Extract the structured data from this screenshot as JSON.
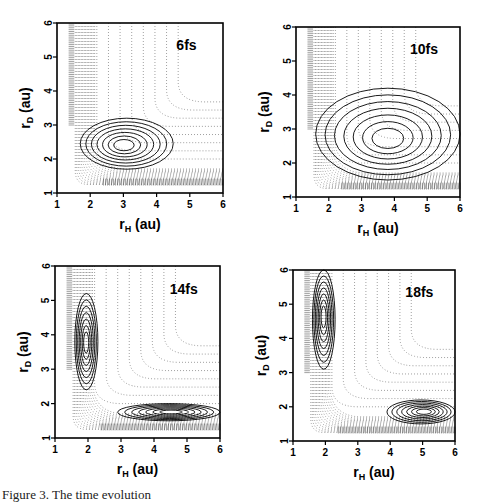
{
  "figure": {
    "caption": "Figure 3. The time evolution",
    "panels": [
      {
        "label": "6fs",
        "xlabel_main": "r",
        "xlabel_sub": "H",
        "xlabel_unit": "(au)",
        "ylabel_main": "r",
        "ylabel_sub": "D",
        "ylabel_unit": "(au)"
      },
      {
        "label": "10fs",
        "xlabel_main": "r",
        "xlabel_sub": "H",
        "xlabel_unit": "(au)",
        "ylabel_main": "r",
        "ylabel_sub": "D",
        "ylabel_unit": "(au)"
      },
      {
        "label": "14fs",
        "xlabel_main": "r",
        "xlabel_sub": "H",
        "xlabel_unit": "(au)",
        "ylabel_main": "r",
        "ylabel_sub": "D",
        "ylabel_unit": "(au)"
      },
      {
        "label": "18fs",
        "xlabel_main": "r",
        "xlabel_sub": "H",
        "xlabel_unit": "(au)",
        "ylabel_main": "r",
        "ylabel_sub": "D",
        "ylabel_unit": "(au)"
      }
    ],
    "xticks": [
      "1",
      "2",
      "3",
      "4",
      "5",
      "6"
    ],
    "yticks": [
      "1",
      "2",
      "3",
      "4",
      "5",
      "6"
    ]
  },
  "chart_data": [
    {
      "type": "heatmap",
      "title": "6fs",
      "xlabel": "r_H (au)",
      "ylabel": "r_D (au)",
      "xlim": [
        1,
        6
      ],
      "ylim": [
        1,
        6
      ],
      "description": "Wavepacket contours (solid) localized near r_H 1.7-4.5, r_D 1.7-3.2 over dotted potential energy contours",
      "packets": [
        {
          "center": [
            2.4,
            2.1
          ],
          "extent_x": [
            1.7,
            4.5
          ],
          "extent_y": [
            1.7,
            3.2
          ]
        }
      ]
    },
    {
      "type": "heatmap",
      "title": "10fs",
      "xlabel": "r_H (au)",
      "ylabel": "r_D (au)",
      "xlim": [
        1,
        6
      ],
      "ylim": [
        1,
        6
      ],
      "description": "Wavepacket elongated along L-shaped valley from r_D~4.2 down to r_H~6",
      "packets": [
        {
          "center": [
            3.8,
            1.8
          ],
          "extent_x": [
            1.6,
            6
          ],
          "extent_y": [
            1.5,
            4.2
          ]
        }
      ]
    },
    {
      "type": "heatmap",
      "title": "14fs",
      "xlabel": "r_H (au)",
      "ylabel": "r_D (au)",
      "xlim": [
        1,
        6
      ],
      "ylim": [
        1,
        6
      ],
      "description": "Wavepacket split into two channels",
      "packets": [
        {
          "center": [
            1.9,
            3.6
          ],
          "extent_x": [
            1.6,
            2.3
          ],
          "extent_y": [
            2.4,
            5.2
          ]
        },
        {
          "center": [
            5,
            1.8
          ],
          "extent_x": [
            2.9,
            6
          ],
          "extent_y": [
            1.5,
            2.0
          ]
        }
      ]
    },
    {
      "type": "heatmap",
      "title": "18fs",
      "xlabel": "r_H (au)",
      "ylabel": "r_D (au)",
      "xlim": [
        1,
        6
      ],
      "ylim": [
        1,
        6
      ],
      "description": "Two separated wavepackets moving out of the interaction region",
      "packets": [
        {
          "center": [
            1.9,
            5.2
          ],
          "extent_x": [
            1.6,
            2.3
          ],
          "extent_y": [
            3.1,
            6
          ]
        },
        {
          "center": [
            5.7,
            1.9
          ],
          "extent_x": [
            3.9,
            6
          ],
          "extent_y": [
            1.5,
            2.2
          ]
        }
      ]
    }
  ]
}
